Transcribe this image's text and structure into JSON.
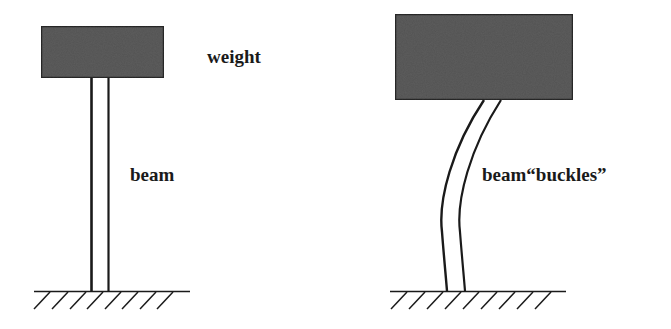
{
  "figure": {
    "left_panel": {
      "name": "unloaded-column",
      "weight_label": "weight",
      "beam_label": "beam"
    },
    "right_panel": {
      "name": "buckled-column",
      "beam_label": "beam“buckles”"
    }
  },
  "colors": {
    "weight_fill": "#5a5a5a",
    "stroke": "#1a1a1a",
    "background": "#ffffff"
  }
}
